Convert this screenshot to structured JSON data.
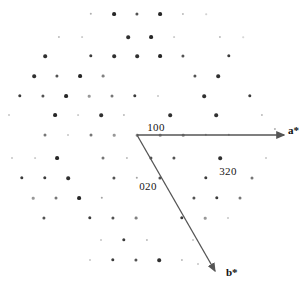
{
  "figure": {
    "type": "electron-diffraction-pattern",
    "background_color": "#ffffff",
    "spot_color": "#1a1a1a",
    "vector_color": "#555555",
    "width": 303,
    "height": 288
  },
  "chart_data": {
    "type": "scatter",
    "title": "",
    "xlabel": "",
    "ylabel": "",
    "xlim": [
      0,
      303
    ],
    "ylim": [
      288,
      0
    ],
    "grid": false,
    "legend": null,
    "origin_px": [
      137,
      135
    ],
    "basis_vectors_px": {
      "a_star": [
        23.2,
        0.0
      ],
      "b_star": [
        13.2,
        22.9
      ]
    },
    "annotations": [
      {
        "label": "100",
        "x": 156,
        "y": 127
      },
      {
        "label": "020",
        "x": 148,
        "y": 186
      },
      {
        "label": "320",
        "x": 228,
        "y": 171
      },
      {
        "label": "a*",
        "x": 288,
        "y": 130
      },
      {
        "label": "b*",
        "x": 226,
        "y": 272
      }
    ],
    "vectors": [
      {
        "name": "a*",
        "x1": 137,
        "y1": 135,
        "x2": 284,
        "y2": 135
      },
      {
        "name": "b*",
        "x1": 137,
        "y1": 135,
        "x2": 215,
        "y2": 271
      }
    ],
    "spots": [
      {
        "x": 91,
        "y": 14,
        "r": 1.2,
        "i": 0.35
      },
      {
        "x": 114,
        "y": 14,
        "r": 1.9,
        "i": 0.95
      },
      {
        "x": 137,
        "y": 14,
        "r": 1.6,
        "i": 0.75
      },
      {
        "x": 160,
        "y": 14,
        "r": 1.9,
        "i": 0.95
      },
      {
        "x": 183,
        "y": 14,
        "r": 1.1,
        "i": 0.3
      },
      {
        "x": 206,
        "y": 14,
        "r": 0.8,
        "i": 0.2
      },
      {
        "x": 59,
        "y": 37,
        "r": 1.1,
        "i": 0.3
      },
      {
        "x": 82,
        "y": 37,
        "r": 0.9,
        "i": 0.22
      },
      {
        "x": 128,
        "y": 37,
        "r": 1.8,
        "i": 0.9
      },
      {
        "x": 151,
        "y": 37,
        "r": 1.9,
        "i": 0.95
      },
      {
        "x": 174,
        "y": 37,
        "r": 0.9,
        "i": 0.22
      },
      {
        "x": 220,
        "y": 37,
        "r": 1.1,
        "i": 0.3
      },
      {
        "x": 243,
        "y": 37,
        "r": 0.8,
        "i": 0.18
      },
      {
        "x": 45,
        "y": 56,
        "r": 1.8,
        "i": 0.9
      },
      {
        "x": 91,
        "y": 56,
        "r": 1.7,
        "i": 0.85
      },
      {
        "x": 114,
        "y": 56,
        "r": 1.8,
        "i": 0.9
      },
      {
        "x": 137,
        "y": 56,
        "r": 1.8,
        "i": 0.9
      },
      {
        "x": 160,
        "y": 56,
        "r": 1.9,
        "i": 0.95
      },
      {
        "x": 183,
        "y": 56,
        "r": 1.6,
        "i": 0.75
      },
      {
        "x": 229,
        "y": 56,
        "r": 1.7,
        "i": 0.85
      },
      {
        "x": 34,
        "y": 76,
        "r": 1.8,
        "i": 0.9
      },
      {
        "x": 57,
        "y": 76,
        "r": 1.6,
        "i": 0.75
      },
      {
        "x": 80,
        "y": 76,
        "r": 1.9,
        "i": 0.95
      },
      {
        "x": 103,
        "y": 76,
        "r": 1.4,
        "i": 0.55
      },
      {
        "x": 195,
        "y": 76,
        "r": 1.6,
        "i": 0.75
      },
      {
        "x": 218,
        "y": 76,
        "r": 1.8,
        "i": 0.9
      },
      {
        "x": 20,
        "y": 96,
        "r": 1.7,
        "i": 0.85
      },
      {
        "x": 43,
        "y": 96,
        "r": 1.6,
        "i": 0.75
      },
      {
        "x": 66,
        "y": 96,
        "r": 1.9,
        "i": 0.95
      },
      {
        "x": 89,
        "y": 96,
        "r": 1.3,
        "i": 0.45
      },
      {
        "x": 112,
        "y": 96,
        "r": 1.5,
        "i": 0.6
      },
      {
        "x": 135,
        "y": 96,
        "r": 1.7,
        "i": 0.85
      },
      {
        "x": 158,
        "y": 96,
        "r": 1.0,
        "i": 0.25
      },
      {
        "x": 204,
        "y": 96,
        "r": 1.8,
        "i": 0.9
      },
      {
        "x": 250,
        "y": 96,
        "r": 1.7,
        "i": 0.85
      },
      {
        "x": 9,
        "y": 115,
        "r": 1.0,
        "i": 0.25
      },
      {
        "x": 55,
        "y": 115,
        "r": 1.9,
        "i": 0.95
      },
      {
        "x": 78,
        "y": 115,
        "r": 0.9,
        "i": 0.22
      },
      {
        "x": 101,
        "y": 115,
        "r": 1.8,
        "i": 0.9
      },
      {
        "x": 124,
        "y": 115,
        "r": 1.1,
        "i": 0.3
      },
      {
        "x": 170,
        "y": 115,
        "r": 1.8,
        "i": 0.9
      },
      {
        "x": 216,
        "y": 115,
        "r": 1.8,
        "i": 0.9
      },
      {
        "x": 262,
        "y": 115,
        "r": 1.1,
        "i": 0.3
      },
      {
        "x": 45,
        "y": 135,
        "r": 1.5,
        "i": 0.6
      },
      {
        "x": 68,
        "y": 135,
        "r": 1.0,
        "i": 0.25
      },
      {
        "x": 91,
        "y": 135,
        "r": 1.5,
        "i": 0.6
      },
      {
        "x": 114,
        "y": 135,
        "r": 1.3,
        "i": 0.45
      },
      {
        "x": 137,
        "y": 135,
        "r": 1.3,
        "i": 0.5
      },
      {
        "x": 160,
        "y": 135,
        "r": 1.3,
        "i": 0.5
      },
      {
        "x": 183,
        "y": 135,
        "r": 1.3,
        "i": 0.5
      },
      {
        "x": 206,
        "y": 135,
        "r": 1.2,
        "i": 0.4
      },
      {
        "x": 229,
        "y": 135,
        "r": 1.2,
        "i": 0.4
      },
      {
        "x": 275,
        "y": 129,
        "r": 1.1,
        "i": 0.35
      },
      {
        "x": 12,
        "y": 158,
        "r": 1.0,
        "i": 0.25
      },
      {
        "x": 35,
        "y": 158,
        "r": 0.9,
        "i": 0.22
      },
      {
        "x": 57,
        "y": 158,
        "r": 1.9,
        "i": 0.95
      },
      {
        "x": 103,
        "y": 158,
        "r": 1.5,
        "i": 0.6
      },
      {
        "x": 127,
        "y": 158,
        "r": 1.1,
        "i": 0.3
      },
      {
        "x": 174,
        "y": 158,
        "r": 1.6,
        "i": 0.75
      },
      {
        "x": 220,
        "y": 158,
        "r": 1.8,
        "i": 0.9
      },
      {
        "x": 266,
        "y": 158,
        "r": 1.0,
        "i": 0.25
      },
      {
        "x": 151,
        "y": 158,
        "r": 1.6,
        "i": 0.75
      },
      {
        "x": 22,
        "y": 178,
        "r": 1.7,
        "i": 0.85
      },
      {
        "x": 45,
        "y": 178,
        "r": 1.7,
        "i": 0.85
      },
      {
        "x": 68,
        "y": 178,
        "r": 1.8,
        "i": 0.9
      },
      {
        "x": 114,
        "y": 178,
        "r": 1.6,
        "i": 0.75
      },
      {
        "x": 137,
        "y": 178,
        "r": 1.2,
        "i": 0.4
      },
      {
        "x": 160,
        "y": 178,
        "r": 1.6,
        "i": 0.75
      },
      {
        "x": 206,
        "y": 178,
        "r": 1.7,
        "i": 0.85
      },
      {
        "x": 252,
        "y": 178,
        "r": 1.5,
        "i": 0.6
      },
      {
        "x": 33,
        "y": 198,
        "r": 1.3,
        "i": 0.45
      },
      {
        "x": 56,
        "y": 198,
        "r": 1.5,
        "i": 0.6
      },
      {
        "x": 79,
        "y": 198,
        "r": 1.9,
        "i": 0.95
      },
      {
        "x": 102,
        "y": 198,
        "r": 1.2,
        "i": 0.4
      },
      {
        "x": 194,
        "y": 198,
        "r": 1.6,
        "i": 0.75
      },
      {
        "x": 217,
        "y": 198,
        "r": 1.7,
        "i": 0.85
      },
      {
        "x": 240,
        "y": 198,
        "r": 1.5,
        "i": 0.6
      },
      {
        "x": 44,
        "y": 218,
        "r": 1.6,
        "i": 0.75
      },
      {
        "x": 90,
        "y": 218,
        "r": 1.7,
        "i": 0.85
      },
      {
        "x": 113,
        "y": 218,
        "r": 1.6,
        "i": 0.75
      },
      {
        "x": 136,
        "y": 218,
        "r": 1.4,
        "i": 0.55
      },
      {
        "x": 182,
        "y": 218,
        "r": 1.7,
        "i": 0.85
      },
      {
        "x": 205,
        "y": 218,
        "r": 1.3,
        "i": 0.45
      },
      {
        "x": 228,
        "y": 218,
        "r": 1.0,
        "i": 0.25
      },
      {
        "x": 101,
        "y": 240,
        "r": 1.0,
        "i": 0.25
      },
      {
        "x": 124,
        "y": 240,
        "r": 1.7,
        "i": 0.85
      },
      {
        "x": 147,
        "y": 240,
        "r": 1.1,
        "i": 0.3
      },
      {
        "x": 193,
        "y": 240,
        "r": 1.0,
        "i": 0.25
      },
      {
        "x": 90,
        "y": 260,
        "r": 1.0,
        "i": 0.25
      },
      {
        "x": 113,
        "y": 260,
        "r": 1.7,
        "i": 0.85
      },
      {
        "x": 136,
        "y": 260,
        "r": 1.6,
        "i": 0.75
      },
      {
        "x": 159,
        "y": 260,
        "r": 1.8,
        "i": 0.9
      },
      {
        "x": 182,
        "y": 260,
        "r": 1.1,
        "i": 0.3
      },
      {
        "x": 198,
        "y": 264,
        "r": 1.0,
        "i": 0.25
      }
    ]
  }
}
